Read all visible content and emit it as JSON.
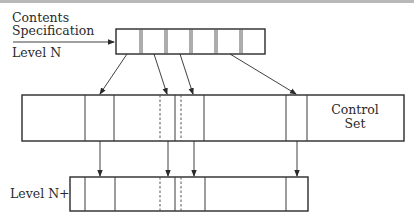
{
  "labels": {
    "contents": "Contents",
    "specification": "Specification",
    "level_n": "Level N",
    "level_n1": "Level N+1",
    "control": "Control",
    "set": "Set"
  },
  "diagram": {
    "top_box": {
      "x": 116,
      "y": 29,
      "w": 149,
      "h": 25,
      "cells": 6,
      "dividers": [
        141,
        166,
        191,
        216,
        241
      ]
    },
    "middle_box": {
      "x": 22,
      "y": 95,
      "w": 382,
      "h": 46,
      "solid_lines": [
        85,
        114,
        175,
        204,
        286,
        307
      ],
      "dashed_lines": [
        160,
        181
      ]
    },
    "bottom_box": {
      "x": 70,
      "y": 177,
      "w": 238,
      "h": 34,
      "solid_lines": [
        85,
        115,
        175,
        205,
        286
      ],
      "dashed_lines": [
        160,
        181
      ]
    },
    "arrows_top_to_middle": [
      [
        127,
        54,
        100,
        94
      ],
      [
        154,
        54,
        167,
        94
      ],
      [
        180,
        54,
        193,
        94
      ],
      [
        230,
        54,
        296,
        94
      ]
    ],
    "arrows_middle_to_bottom": [
      100,
      168,
      194,
      297
    ],
    "input_arrow": [
      13,
      42,
      115,
      42
    ]
  },
  "colors": {
    "line": "#2a2a2a",
    "rule": "#b9b9b9",
    "background": "#ffffff"
  }
}
